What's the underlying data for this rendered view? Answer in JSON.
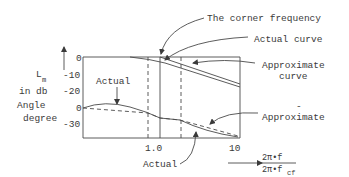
{
  "diagram": {
    "type": "bode-plot-sketch",
    "labels": {
      "corner_frequency": "The corner frequency",
      "actual_curve": "Actual curve",
      "approximate_curve_line1": "Approximate",
      "approximate_curve_line2": "curve",
      "actual_phase_top": "Actual",
      "approximate_phase": "Approximate",
      "actual_phase_bottom": "Actual",
      "dot_mark": "-"
    },
    "y_axis": {
      "magnitude_label_main": "L",
      "magnitude_label_sub": "m",
      "magnitude_units": "in db",
      "angle_label_line1": "Angle",
      "angle_label_line2": "degree",
      "magnitude_ticks": [
        "0",
        "-10",
        "-20"
      ],
      "angle_ticks": [
        "0",
        "-30"
      ]
    },
    "x_axis": {
      "ticks": [
        "1.0",
        "10"
      ],
      "ratio_numerator": "2π•f",
      "ratio_denominator_main": "2π•f",
      "ratio_denominator_sub": "cf"
    },
    "colors": {
      "line": "#4a4a4a",
      "text": "#3a3a3a",
      "background": "#ffffff"
    }
  }
}
